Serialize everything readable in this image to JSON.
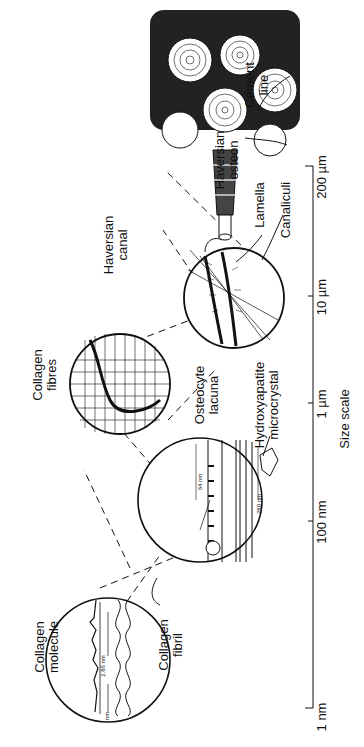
{
  "labels": {
    "collagen_molecule": "Collagen\nmolecule",
    "collagen_fibril": "Collagen\nfibril",
    "collagen_fibres": "Collagen\nfibres",
    "hydroxyapatite": "Hydroxyapatite\nmicrocrystal",
    "osteocyte_lacuna": "Osteocyte\nlacuna",
    "lamella": "Lamella",
    "canaliculi": "Canaliculi",
    "haversian_canal": "Haversian\ncanal",
    "haversian_osteon": "Haversian\nosteon",
    "cement_line": "Cement\nline"
  },
  "dimensions": {
    "molecule_period": "2.86 nm",
    "molecule_width": "nm",
    "fibril_gap": "64 nm",
    "fibril_period": "280 nm"
  },
  "scale": {
    "title": "Size scale",
    "ticks": [
      "1 nm",
      "100 nm",
      "1 µm",
      "10 µm",
      "200 µm"
    ]
  }
}
